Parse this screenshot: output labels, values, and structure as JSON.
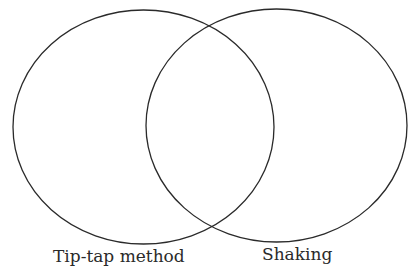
{
  "diagram": {
    "type": "venn",
    "sets": [
      {
        "label": "Tip-tap method"
      },
      {
        "label": "Shaking"
      }
    ],
    "stroke_color": "#2a2a2a",
    "background": "#ffffff"
  }
}
